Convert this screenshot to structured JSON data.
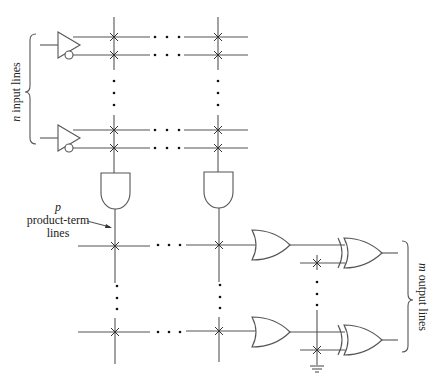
{
  "labels": {
    "input_var": "n",
    "input_text": " input lines",
    "product_var": "p",
    "product_line1": "product-term",
    "product_line2": "lines",
    "output_var": "m",
    "output_text": " output lines"
  },
  "colors": {
    "line": "#555555",
    "background": "#ffffff"
  }
}
